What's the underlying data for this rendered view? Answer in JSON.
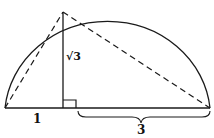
{
  "diagram": {
    "title": "",
    "labels": {
      "left_segment": "1",
      "height": "√3",
      "right_segment": "3"
    },
    "colors": {
      "stroke": "#1a1a1a",
      "background": "#ffffff"
    },
    "elements": [
      "semicircle",
      "diameter",
      "perpendicular height",
      "dashed chord left",
      "dashed chord right",
      "right-angle marker",
      "brace under right segment"
    ]
  }
}
